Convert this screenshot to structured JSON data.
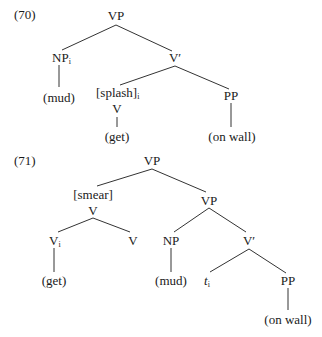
{
  "examples": [
    {
      "number": "(70)",
      "nodes": {
        "root": {
          "label": "VP"
        },
        "np": {
          "label": "NP",
          "subscript": "i"
        },
        "np_leaf": {
          "label": "(mud)"
        },
        "vbar": {
          "label": "V′"
        },
        "splash": {
          "label": "[splash]",
          "subscript": "i"
        },
        "v": {
          "label": "V"
        },
        "v_leaf": {
          "label": "(get)"
        },
        "pp": {
          "label": "PP"
        },
        "pp_leaf": {
          "label": "(on wall)"
        }
      }
    },
    {
      "number": "(71)",
      "nodes": {
        "root": {
          "label": "VP"
        },
        "smear": {
          "label": "[smear]"
        },
        "v_complex": {
          "label": "V"
        },
        "vi": {
          "label": "V",
          "subscript": "i"
        },
        "vi_leaf": {
          "label": "(get)"
        },
        "v_right": {
          "label": "V"
        },
        "vp_inner": {
          "label": "VP"
        },
        "np": {
          "label": "NP"
        },
        "np_leaf": {
          "label": "(mud)"
        },
        "vbar": {
          "label": "V′"
        },
        "trace": {
          "label": "t",
          "subscript": "i"
        },
        "pp": {
          "label": "PP"
        },
        "pp_leaf": {
          "label": "(on wall)"
        }
      }
    }
  ]
}
